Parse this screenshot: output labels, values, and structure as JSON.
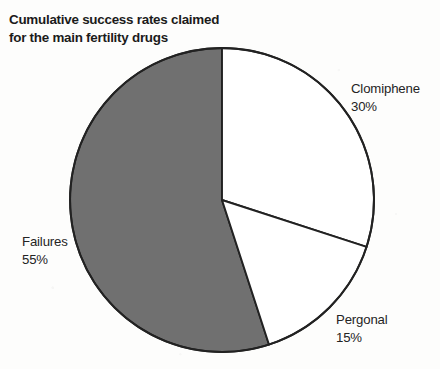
{
  "chart_data": {
    "type": "pie",
    "title": "Cumulative success rates claimed\nfor the main fertility drugs",
    "categories": [
      "Clomiphene",
      "Pergonal",
      "Failures"
    ],
    "values": [
      30,
      15,
      55
    ],
    "unit": "%",
    "start_angle_deg": 0,
    "direction": "clockwise",
    "legend": "none",
    "grid": false,
    "slices": [
      {
        "name": "Clomiphene",
        "value": 30,
        "label": "Clomiphene",
        "value_label": "30%",
        "display": "Clomiphene\n30%",
        "color": "#ffffff",
        "stroke": "#222222",
        "start_deg": 0,
        "end_deg": 108
      },
      {
        "name": "Pergonal",
        "value": 15,
        "label": "Pergonal",
        "value_label": "15%",
        "display": "Pergonal\n15%",
        "color": "#ffffff",
        "stroke": "#222222",
        "start_deg": 108,
        "end_deg": 162
      },
      {
        "name": "Failures",
        "value": 55,
        "label": "Failures",
        "value_label": "55%",
        "display": "Failures\n55%",
        "color": "#707070",
        "stroke": "#222222",
        "start_deg": 162,
        "end_deg": 360
      }
    ],
    "geometry": {
      "center_x": 222,
      "center_y": 200,
      "radius": 152
    },
    "colors": {
      "background": "#fdfdfc",
      "outline": "#222222",
      "gray_slice": "#707070",
      "white_slice": "#ffffff",
      "text": "#242424",
      "title_text": "#1b1b1b"
    }
  }
}
